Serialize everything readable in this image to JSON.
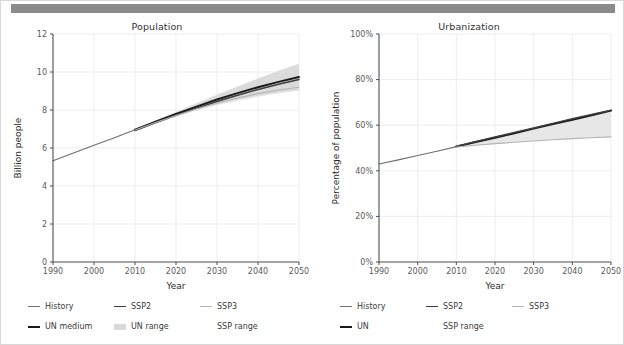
{
  "window": {
    "toolbar_color": "#8a8a8a",
    "background": "#ffffff",
    "border_color": "#d8d8d8"
  },
  "colors": {
    "history": "#6e6e6e",
    "un_medium": "#1a1a1a",
    "un": "#1a1a1a",
    "ssp2": "#3d3d3d",
    "ssp3": "#b4b4b4",
    "un_range": "#d9d9d9",
    "ssp_range": "#e6e6e6",
    "grid": "#e9e9e9",
    "axis": "#4d4d4d",
    "tick_text": "#5a5a5a",
    "title_text": "#303030"
  },
  "charts": [
    {
      "id": "population",
      "title": "Population",
      "legend": [
        {
          "label": "History",
          "type": "line",
          "color": "#6e6e6e",
          "width": 1.2
        },
        {
          "label": "SSP2",
          "type": "line",
          "color": "#3d3d3d",
          "width": 1.6
        },
        {
          "label": "SSP3",
          "type": "line",
          "color": "#b4b4b4",
          "width": 1.2
        },
        {
          "label": "UN medium",
          "type": "line",
          "color": "#1a1a1a",
          "width": 2.0
        },
        {
          "label": "UN range",
          "type": "band",
          "color": "#d9d9d9"
        },
        {
          "label": "SSP range",
          "type": "none",
          "color": "#e6e6e6"
        }
      ]
    },
    {
      "id": "urbanization",
      "title": "Urbanization",
      "legend": [
        {
          "label": "History",
          "type": "line",
          "color": "#6e6e6e",
          "width": 1.2
        },
        {
          "label": "SSP2",
          "type": "line",
          "color": "#3d3d3d",
          "width": 1.6
        },
        {
          "label": "SSP3",
          "type": "line",
          "color": "#b4b4b4",
          "width": 1.2
        },
        {
          "label": "UN",
          "type": "line",
          "color": "#1a1a1a",
          "width": 2.0
        },
        {
          "label": "SSP range",
          "type": "none",
          "color": "#e6e6e6"
        },
        {
          "label": "",
          "type": "none",
          "color": "#ffffff"
        }
      ]
    }
  ],
  "chart_data": [
    {
      "type": "line",
      "id": "population",
      "title": "Population",
      "xlabel": "Year",
      "ylabel": "Billion people",
      "xlim": [
        1990,
        2050
      ],
      "ylim": [
        0,
        12
      ],
      "xticks": [
        1990,
        2000,
        2010,
        2020,
        2030,
        2040,
        2050
      ],
      "xticklabels": [
        "1990",
        "2000",
        "2010",
        "2020",
        "2030",
        "2040",
        "2050"
      ],
      "yticks": [
        0,
        2,
        4,
        6,
        8,
        10,
        12
      ],
      "yticklabels": [
        "0",
        "2",
        "4",
        "6",
        "8",
        "10",
        "12"
      ],
      "grid": true,
      "legend_position": "below",
      "x": [
        1990,
        1995,
        2000,
        2005,
        2010,
        2015,
        2020,
        2025,
        2030,
        2035,
        2040,
        2045,
        2050
      ],
      "series": [
        {
          "name": "History",
          "color": "#6e6e6e",
          "x": [
            1990,
            1995,
            2000,
            2005,
            2010
          ],
          "values": [
            5.33,
            5.74,
            6.14,
            6.54,
            6.96
          ]
        },
        {
          "name": "UN medium",
          "color": "#1a1a1a",
          "x": [
            2010,
            2015,
            2020,
            2025,
            2030,
            2035,
            2040,
            2045,
            2050
          ],
          "values": [
            6.96,
            7.38,
            7.79,
            8.18,
            8.55,
            8.89,
            9.2,
            9.48,
            9.74
          ]
        },
        {
          "name": "SSP2",
          "color": "#3d3d3d",
          "x": [
            2010,
            2015,
            2020,
            2025,
            2030,
            2035,
            2040,
            2045,
            2050
          ],
          "values": [
            6.92,
            7.33,
            7.72,
            8.1,
            8.45,
            8.78,
            9.08,
            9.35,
            9.6
          ]
        },
        {
          "name": "SSP3",
          "color": "#b4b4b4",
          "x": [
            2010,
            2015,
            2020,
            2025,
            2030,
            2035,
            2040,
            2045,
            2050
          ],
          "values": [
            6.95,
            7.34,
            7.71,
            8.05,
            8.36,
            8.63,
            8.86,
            9.05,
            9.2
          ]
        }
      ],
      "bands": [
        {
          "name": "UN range",
          "color": "#d9d9d9",
          "x": [
            2010,
            2015,
            2020,
            2025,
            2030,
            2035,
            2040,
            2045,
            2050
          ],
          "lower": [
            6.96,
            7.34,
            7.7,
            8.02,
            8.3,
            8.54,
            8.75,
            8.92,
            9.07
          ],
          "upper": [
            6.96,
            7.43,
            7.89,
            8.35,
            8.8,
            9.24,
            9.66,
            10.06,
            10.44
          ]
        },
        {
          "name": "SSP range",
          "color": "#e6e6e6",
          "x": [
            2010,
            2015,
            2020,
            2025,
            2030,
            2035,
            2040,
            2045,
            2050
          ],
          "lower": [
            6.92,
            7.3,
            7.65,
            7.97,
            8.25,
            8.49,
            8.7,
            8.88,
            9.03
          ],
          "upper": [
            6.96,
            7.38,
            7.8,
            8.2,
            8.6,
            8.98,
            9.33,
            9.66,
            9.96
          ]
        }
      ]
    },
    {
      "type": "line",
      "id": "urbanization",
      "title": "Urbanization",
      "xlabel": "Year",
      "ylabel": "Percentage of population",
      "xlim": [
        1990,
        2050
      ],
      "ylim": [
        0,
        100
      ],
      "xticks": [
        1990,
        2000,
        2010,
        2020,
        2030,
        2040,
        2050
      ],
      "xticklabels": [
        "1990",
        "2000",
        "2010",
        "2020",
        "2030",
        "2040",
        "2050"
      ],
      "yticks": [
        0,
        20,
        40,
        60,
        80,
        100
      ],
      "yticklabels": [
        "0%",
        "20%",
        "40%",
        "60%",
        "80%",
        "100%"
      ],
      "grid": true,
      "legend_position": "below",
      "series": [
        {
          "name": "History",
          "color": "#6e6e6e",
          "x": [
            1990,
            1995,
            2000,
            2005,
            2010
          ],
          "values": [
            43.0,
            44.8,
            46.7,
            48.6,
            50.6
          ]
        },
        {
          "name": "UN",
          "color": "#1a1a1a",
          "x": [
            2010,
            2015,
            2020,
            2025,
            2030,
            2035,
            2040,
            2045,
            2050
          ],
          "values": [
            50.6,
            52.6,
            54.5,
            56.5,
            58.5,
            60.5,
            62.4,
            64.4,
            66.4
          ]
        },
        {
          "name": "SSP2",
          "color": "#3d3d3d",
          "x": [
            2010,
            2015,
            2020,
            2025,
            2030,
            2035,
            2040,
            2045,
            2050
          ],
          "values": [
            50.8,
            52.8,
            54.8,
            56.8,
            58.8,
            60.8,
            62.8,
            64.7,
            66.6
          ]
        },
        {
          "name": "SSP3",
          "color": "#b4b4b4",
          "x": [
            2010,
            2015,
            2020,
            2025,
            2030,
            2035,
            2040,
            2045,
            2050
          ],
          "values": [
            50.4,
            51.2,
            51.9,
            52.5,
            53.1,
            53.6,
            54.1,
            54.5,
            54.9
          ]
        }
      ],
      "bands": [
        {
          "name": "SSP range",
          "color": "#e6e6e6",
          "x": [
            2010,
            2015,
            2020,
            2025,
            2030,
            2035,
            2040,
            2045,
            2050
          ],
          "lower": [
            50.4,
            51.2,
            51.9,
            52.5,
            53.1,
            53.6,
            54.1,
            54.5,
            54.9
          ],
          "upper": [
            50.8,
            52.8,
            54.8,
            56.8,
            58.8,
            60.8,
            62.8,
            64.7,
            66.6
          ]
        }
      ]
    }
  ]
}
